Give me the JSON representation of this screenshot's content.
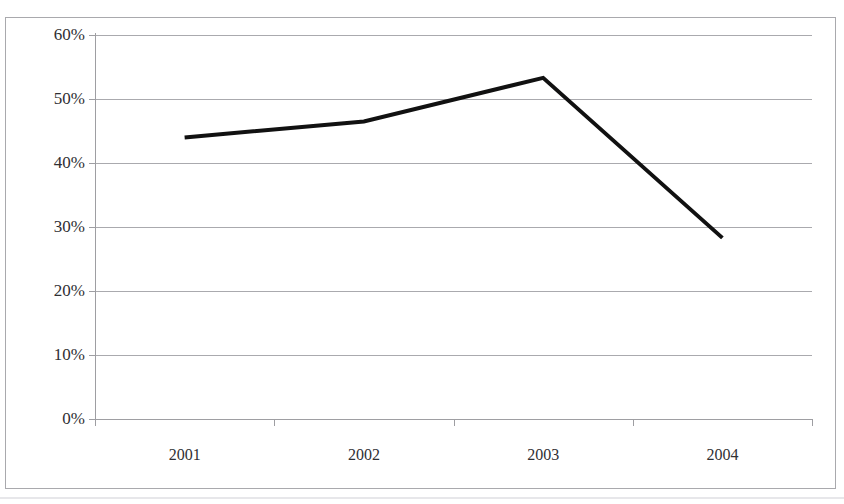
{
  "chart_data": {
    "type": "line",
    "title": "",
    "xlabel": "",
    "ylabel": "",
    "categories": [
      "2001",
      "2002",
      "2003",
      "2004"
    ],
    "series": [
      {
        "name": "",
        "values": [
          44.0,
          46.5,
          53.3,
          28.3
        ]
      }
    ],
    "ylim": [
      0,
      60
    ],
    "ytick_labels": [
      "0%",
      "10%",
      "20%",
      "30%",
      "40%",
      "50%",
      "60%"
    ],
    "ytick_values": [
      0,
      10,
      20,
      30,
      40,
      50,
      60
    ],
    "grid": true,
    "grid_axis": "y",
    "legend": false,
    "legend_position": "none",
    "line_color": "#111111",
    "line_width": 4,
    "markers": false,
    "plot_background": "#ffffff",
    "grid_color": "#aaaaae",
    "axis_color": "#9e9ea2",
    "frame_color": "#a9a9ad",
    "text_color": "#2f2f33"
  },
  "figure": {
    "border_visible": true,
    "title_remnant": "",
    "background": "#ffffff"
  }
}
